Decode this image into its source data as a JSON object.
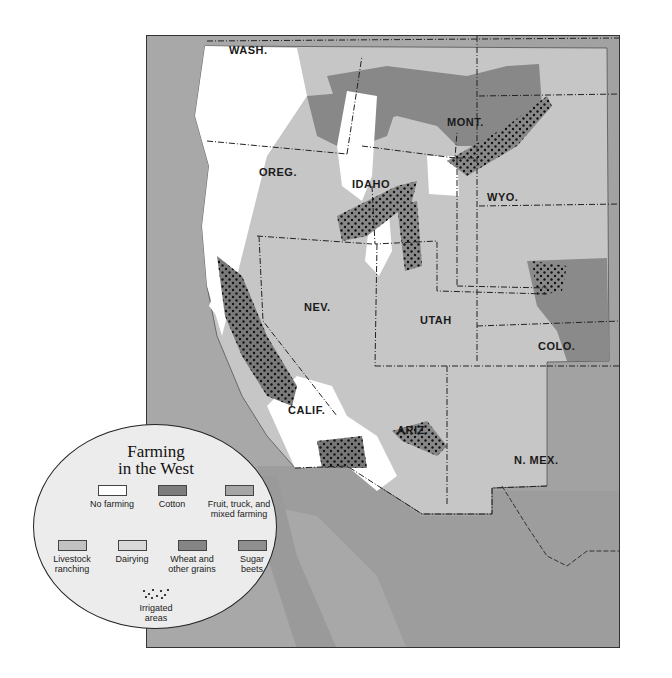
{
  "map": {
    "title_line1": "Farming",
    "title_line2": "in the West",
    "state_labels": [
      {
        "id": "wash",
        "text": "WASH."
      },
      {
        "id": "oreg",
        "text": "OREG."
      },
      {
        "id": "idaho",
        "text": "IDAHO"
      },
      {
        "id": "mont",
        "text": "MONT."
      },
      {
        "id": "wyo",
        "text": "WYO."
      },
      {
        "id": "nev",
        "text": "NEV."
      },
      {
        "id": "utah",
        "text": "UTAH"
      },
      {
        "id": "colo",
        "text": "COLO."
      },
      {
        "id": "calif",
        "text": "CALIF."
      },
      {
        "id": "ariz",
        "text": "ARIZ."
      },
      {
        "id": "nmex",
        "text": "N. MEX."
      }
    ]
  },
  "legend": {
    "items": [
      {
        "label": "No farming",
        "color": "#ffffff"
      },
      {
        "label": "Cotton",
        "color": "#7d7d7d"
      },
      {
        "label": "Fruit, truck, and mixed farming",
        "color": "#a6a6a6"
      },
      {
        "label": "Livestock ranching",
        "color": "#c2c2c2"
      },
      {
        "label": "Dairying",
        "color": "#d9d9d9"
      },
      {
        "label": "Wheat and other grains",
        "color": "#858585"
      },
      {
        "label": "Sugar beets",
        "color": "#8f8f8f"
      },
      {
        "label": "Irrigated areas",
        "pattern": "dots"
      }
    ]
  },
  "colors": {
    "ocean": "#a8a8a8",
    "outside_region": "#a3a3a3",
    "livestock": "#c8c8c8",
    "no_farming": "#ffffff",
    "wheat": "#868686",
    "fruit_mixed": "#a9a9a9",
    "border": "#222222"
  }
}
